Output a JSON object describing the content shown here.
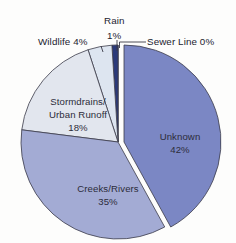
{
  "chart_data": {
    "type": "pie",
    "title": "",
    "subtitle": "",
    "xlabel": "",
    "ylabel": "",
    "legend_position": "none",
    "grid": false,
    "categories": [
      "Unknown",
      "Creeks/Rivers",
      "Stormdrains/Urban Runoff",
      "Wildlife",
      "Rain",
      "Sewer Line"
    ],
    "values": [
      42,
      35,
      18,
      4,
      1,
      0
    ],
    "value_unit": "%",
    "colors": [
      "#7b87c4",
      "#a3abd4",
      "#e2e6ee",
      "#dde5f0",
      "#2b3a7a",
      "#ffffff"
    ],
    "exploded": [
      "Unknown"
    ],
    "slices": [
      {
        "name": "Unknown",
        "value": 42,
        "value_text": "42%",
        "color": "#7b87c4",
        "label_line1": "Unknown",
        "label_line2": "42%",
        "label_placement": "inside"
      },
      {
        "name": "Creeks/Rivers",
        "value": 35,
        "value_text": "35%",
        "color": "#a3abd4",
        "label_line1": "Creeks/Rivers",
        "label_line2": "35%",
        "label_placement": "inside"
      },
      {
        "name": "Stormdrains/Urban Runoff",
        "value": 18,
        "value_text": "18%",
        "color": "#e2e6ee",
        "label_line1": "Stormdrains/",
        "label_line2": "Urban Runoff",
        "label_line3": "18%",
        "label_placement": "inside"
      },
      {
        "name": "Wildlife",
        "value": 4,
        "value_text": "4%",
        "color": "#dde5f0",
        "label_line1": "Wildlife 4%",
        "label_placement": "outside-left"
      },
      {
        "name": "Rain",
        "value": 1,
        "value_text": "1%",
        "color": "#2b3a7a",
        "label_line1": "Rain",
        "label_line2": "1%",
        "label_placement": "outside-top"
      },
      {
        "name": "Sewer Line",
        "value": 0,
        "value_text": "0%",
        "color": "#ffffff",
        "label_line1": "Sewer Line 0%",
        "label_placement": "outside-right"
      }
    ]
  },
  "labels": {
    "unknown_name": "Unknown",
    "unknown_value": "42%",
    "creeks_name": "Creeks/Rivers",
    "creeks_value": "35%",
    "stormdrains_line1": "Stormdrains/",
    "stormdrains_line2": "Urban Runoff",
    "stormdrains_value": "18%",
    "wildlife": "Wildlife 4%",
    "rain_name": "Rain",
    "rain_value": "1%",
    "sewer": "Sewer Line 0%"
  },
  "colors": {
    "background": "#fdfdfc",
    "unknown": "#7b87c4",
    "creeks": "#a3abd4",
    "stormdrains": "#e2e6ee",
    "wildlife": "#dde5f0",
    "rain": "#2b3a7a",
    "sewer": "#ffffff",
    "outline": "#3b3b49",
    "text": "#23232f"
  }
}
